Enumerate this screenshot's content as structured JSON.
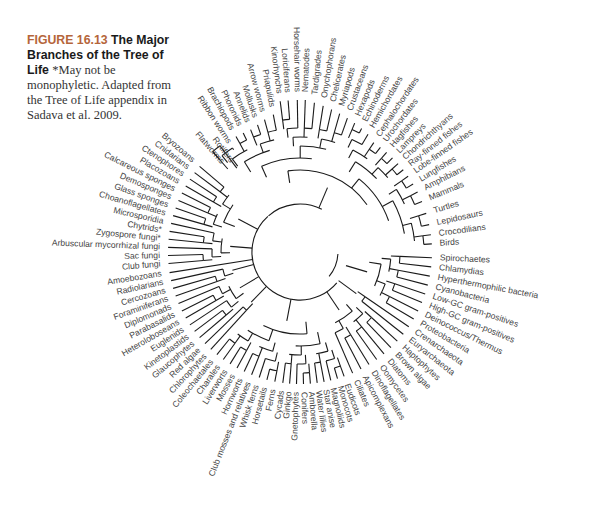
{
  "caption": {
    "figure_label": "FIGURE 16.13",
    "title": "The Major Branches of the Tree of Life",
    "note": "*May not be monophyletic. Adapted from the Tree of Life appendix in Sadava et al. 2009."
  },
  "tree": {
    "center": [
      300,
      252
    ],
    "colors": {
      "branch": "#1a1a1a",
      "label": "#444444",
      "figure_label": "#b5653a"
    },
    "leaves": [
      {
        "name": "Flatworms",
        "angle": -131,
        "r": 118
      },
      {
        "name": "Rotifers",
        "angle": -127,
        "r": 113
      },
      {
        "name": "Ribbon worms",
        "angle": -123,
        "r": 130
      },
      {
        "name": "Brachiopods",
        "angle": -119,
        "r": 140
      },
      {
        "name": "Phoronids",
        "angle": -115.5,
        "r": 140
      },
      {
        "name": "Annelids",
        "angle": -112,
        "r": 140
      },
      {
        "name": "Mollusks",
        "angle": -108.5,
        "r": 142
      },
      {
        "name": "Arrow worms",
        "angle": -105,
        "r": 145
      },
      {
        "name": "Priapulids",
        "angle": -101,
        "r": 148
      },
      {
        "name": "Kinorhynchs",
        "angle": -97.5,
        "r": 160
      },
      {
        "name": "Loriciferans",
        "angle": -94.5,
        "r": 160
      },
      {
        "name": "Horsehair worms",
        "angle": -91,
        "r": 160
      },
      {
        "name": "Nematodes",
        "angle": -88,
        "r": 160
      },
      {
        "name": "Tardigrades",
        "angle": -84.5,
        "r": 158
      },
      {
        "name": "Onychophorans",
        "angle": -81,
        "r": 156
      },
      {
        "name": "Chelicerates",
        "angle": -77.5,
        "r": 154
      },
      {
        "name": "Myriapods",
        "angle": -74,
        "r": 152
      },
      {
        "name": "Crustaceans",
        "angle": -70.5,
        "r": 150
      },
      {
        "name": "Hexapods",
        "angle": -67,
        "r": 148
      },
      {
        "name": "Echinoderms",
        "angle": -63.5,
        "r": 146
      },
      {
        "name": "Hemichordates",
        "angle": -60,
        "r": 144
      },
      {
        "name": "Cephalochordates",
        "angle": -56,
        "r": 140
      },
      {
        "name": "Urochordates",
        "angle": -52.5,
        "r": 140
      },
      {
        "name": "Hagfishes",
        "angle": -49,
        "r": 140
      },
      {
        "name": "Lampreys",
        "angle": -45.5,
        "r": 140
      },
      {
        "name": "Chondrichthyans",
        "angle": -42,
        "r": 140
      },
      {
        "name": "Ray-finned fishes",
        "angle": -38.5,
        "r": 140
      },
      {
        "name": "Lobe-finned fishes",
        "angle": -35,
        "r": 140
      },
      {
        "name": "Lungfishes",
        "angle": -31,
        "r": 140
      },
      {
        "name": "Amphibians",
        "angle": -27,
        "r": 140
      },
      {
        "name": "Mammals",
        "angle": -22.5,
        "r": 140
      },
      {
        "name": "Turtles",
        "angle": -17,
        "r": 140
      },
      {
        "name": "Lepidosaurs",
        "angle": -12,
        "r": 140
      },
      {
        "name": "Crocodilians",
        "angle": -7.5,
        "r": 140
      },
      {
        "name": "Birds",
        "angle": -3.5,
        "r": 140
      },
      {
        "name": "Spirochaetes",
        "angle": 2.5,
        "r": 140
      },
      {
        "name": "Chlamydias",
        "angle": 6.5,
        "r": 140
      },
      {
        "name": "Hyperthermophilic bacteria",
        "angle": 10.5,
        "r": 140
      },
      {
        "name": "Cyanobacteria",
        "angle": 14.5,
        "r": 140
      },
      {
        "name": "Low-GC gram-positives",
        "angle": 18.5,
        "r": 140
      },
      {
        "name": "High-GC gram-positives",
        "angle": 22.5,
        "r": 140
      },
      {
        "name": "Deinococcus/Thermus",
        "angle": 26.5,
        "r": 140
      },
      {
        "name": "Proteobacteria",
        "angle": 30.5,
        "r": 140
      },
      {
        "name": "Crenarchaeota",
        "angle": 34.5,
        "r": 140
      },
      {
        "name": "Euryarchaeota",
        "angle": 38.5,
        "r": 140
      },
      {
        "name": "Haptophytes",
        "angle": 42.5,
        "r": 140
      },
      {
        "name": "Brown algae",
        "angle": 46.5,
        "r": 140
      },
      {
        "name": "Diatoms",
        "angle": 50.5,
        "r": 140
      },
      {
        "name": "Oomycetes",
        "angle": 54.5,
        "r": 140
      },
      {
        "name": "Dinoflagellates",
        "angle": 58.5,
        "r": 140
      },
      {
        "name": "Apicomplexans",
        "angle": 62.5,
        "r": 140
      },
      {
        "name": "Ciliates",
        "angle": 66.5,
        "r": 140
      },
      {
        "name": "Eudicots",
        "angle": 70.5,
        "r": 140
      },
      {
        "name": "Monocots",
        "angle": 73.5,
        "r": 140
      },
      {
        "name": "Magnoliids",
        "angle": 76.5,
        "r": 140
      },
      {
        "name": "Star anise",
        "angle": 79.5,
        "r": 140
      },
      {
        "name": "Water lilies",
        "angle": 82.5,
        "r": 140
      },
      {
        "name": "Amborella",
        "angle": 85.5,
        "r": 140
      },
      {
        "name": "Conifers",
        "angle": 88.5,
        "r": 140
      },
      {
        "name": "Gnetophytes",
        "angle": 91.5,
        "r": 140
      },
      {
        "name": "Ginkgo",
        "angle": 94.5,
        "r": 140
      },
      {
        "name": "Cycads",
        "angle": 97.5,
        "r": 140
      },
      {
        "name": "Ferns",
        "angle": 101,
        "r": 140
      },
      {
        "name": "Horsetails",
        "angle": 104.5,
        "r": 140
      },
      {
        "name": "Whisk ferns",
        "angle": 108,
        "r": 140
      },
      {
        "name": "Club mosses and relatives",
        "angle": 111.5,
        "r": 140
      },
      {
        "name": "Hornworts",
        "angle": 115,
        "r": 140
      },
      {
        "name": "Mosses",
        "angle": 118.5,
        "r": 140
      },
      {
        "name": "Liverworts",
        "angle": 122,
        "r": 140
      },
      {
        "name": "Charales",
        "angle": 125.5,
        "r": 140
      },
      {
        "name": "Coleochaetales",
        "angle": 129,
        "r": 140
      },
      {
        "name": "Chlorophytes",
        "angle": 132.5,
        "r": 140
      },
      {
        "name": "Red algae",
        "angle": 136,
        "r": 140
      },
      {
        "name": "Glaucophytes",
        "angle": 139.5,
        "r": 140
      },
      {
        "name": "Kinetoplastids",
        "angle": 143,
        "r": 140
      },
      {
        "name": "Euglenids",
        "angle": 146.5,
        "r": 140
      },
      {
        "name": "Heteroloboseans",
        "angle": 150,
        "r": 140
      },
      {
        "name": "Parabasalids",
        "angle": 153.5,
        "r": 140
      },
      {
        "name": "Diplomonads",
        "angle": 157,
        "r": 140
      },
      {
        "name": "Foraminiferans",
        "angle": 160.5,
        "r": 140
      },
      {
        "name": "Cercozoans",
        "angle": 164,
        "r": 140
      },
      {
        "name": "Radiolarians",
        "angle": 167.5,
        "r": 140
      },
      {
        "name": "Amoebozoans",
        "angle": 171,
        "r": 140
      },
      {
        "name": "Club fungi",
        "angle": 175,
        "r": 140
      },
      {
        "name": "Sac fungi",
        "angle": 178.5,
        "r": 140
      },
      {
        "name": "Arbuscular mycorrhizal fungi",
        "angle": 182,
        "r": 140
      },
      {
        "name": "Zygospore fungi*",
        "angle": 185.5,
        "r": 140
      },
      {
        "name": "Chytrids*",
        "angle": 189,
        "r": 140
      },
      {
        "name": "Microsporidia",
        "angle": 192.5,
        "r": 140
      },
      {
        "name": "Choanoflagellates",
        "angle": 196,
        "r": 140
      },
      {
        "name": "Glass sponges",
        "angle": 199.5,
        "r": 140
      },
      {
        "name": "Demosponges",
        "angle": 203,
        "r": 140
      },
      {
        "name": "Calcareous sponges",
        "angle": 206.5,
        "r": 140
      },
      {
        "name": "Placozoans",
        "angle": 210,
        "r": 140
      },
      {
        "name": "Ctenophores",
        "angle": 213.5,
        "r": 140
      },
      {
        "name": "Cnidarians",
        "angle": 217,
        "r": 140
      },
      {
        "name": "Bryozoans",
        "angle": 220.5,
        "r": 140
      }
    ]
  }
}
